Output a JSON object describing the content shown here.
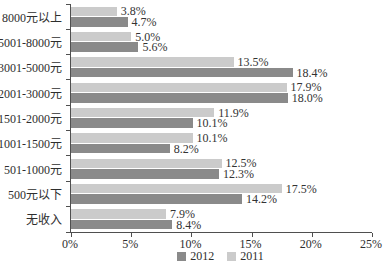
{
  "chart_data": {
    "type": "bar",
    "orientation": "horizontal",
    "title": "",
    "categories": [
      "8000元以上",
      "5001-8000元",
      "3001-5000元",
      "2001-3000元",
      "1501-2000元",
      "1001-1500元",
      "501-1000元",
      "500元以下",
      "无收入"
    ],
    "series": [
      {
        "name": "2012",
        "color": "#8a8a8a",
        "values": [
          4.7,
          5.6,
          18.4,
          18.0,
          10.1,
          8.2,
          12.3,
          14.2,
          8.4
        ],
        "labels": [
          "4.7%",
          "5.6%",
          "18.4%",
          "18.0%",
          "10.1%",
          "8.2%",
          "12.3%",
          "14.2%",
          "8.4%"
        ]
      },
      {
        "name": "2011",
        "color": "#cbcbcb",
        "values": [
          3.8,
          5.0,
          13.5,
          17.9,
          11.9,
          10.1,
          12.5,
          17.5,
          7.9
        ],
        "labels": [
          "3.8%",
          "5.0%",
          "13.5%",
          "17.9%",
          "11.9%",
          "10.1%",
          "12.5%",
          "17.5%",
          "7.9%"
        ]
      }
    ],
    "row_order_top_to_bottom": [
      "2011",
      "2012"
    ],
    "xlim": [
      0,
      25
    ],
    "x_tick_values": [
      0,
      5,
      10,
      15,
      20,
      25
    ],
    "x_tick_labels": [
      "0%",
      "5%",
      "10%",
      "15%",
      "20%",
      "25%"
    ],
    "legend": {
      "position": "bottom",
      "entries": [
        "2012",
        "2011"
      ]
    },
    "grid": false,
    "value_labels_shown": true,
    "colors": {
      "axis": "#4f4f4f",
      "text": "#2e2e2e",
      "background": "#ffffff"
    }
  }
}
